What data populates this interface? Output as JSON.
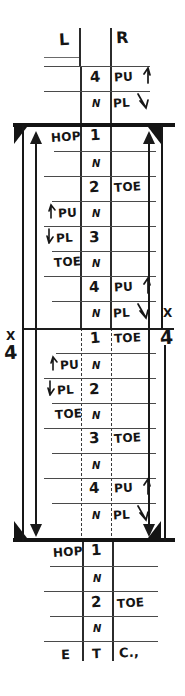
{
  "sheet": {
    "title_row": {
      "left": "L",
      "center": "",
      "right": "R"
    },
    "footer_row": {
      "left": "E",
      "center": "T",
      "right": "C.,"
    },
    "repeat_marks": {
      "left_x": "X",
      "left_count": "4",
      "right_x": "X",
      "right_count": "4"
    },
    "colors": {
      "ink": "#151515",
      "rule": "#4a4a4a",
      "beam": "#141414"
    }
  },
  "columns": {
    "left_header": "L",
    "center_header": "",
    "right_header": "R"
  },
  "rows": [
    {
      "id": "r01",
      "left": "",
      "center": "4",
      "right": "PU",
      "right_arrow": "up",
      "beat": "4"
    },
    {
      "id": "r02",
      "left": "",
      "center": "N",
      "right": "PL",
      "right_arrow": "down",
      "beat": "and"
    },
    {
      "id": "r03",
      "left": "HOP",
      "center": "1",
      "right": "",
      "right_arrow": "",
      "beat": "1"
    },
    {
      "id": "r04",
      "left": "",
      "center": "N",
      "right": "",
      "right_arrow": "",
      "beat": "and"
    },
    {
      "id": "r05",
      "left": "",
      "center": "2",
      "right": "TOE",
      "right_arrow": "",
      "beat": "2"
    },
    {
      "id": "r06",
      "left": "PU",
      "left_arrow": "up",
      "center": "N",
      "right": "",
      "right_arrow": "",
      "beat": "and"
    },
    {
      "id": "r07",
      "left": "PL",
      "left_arrow": "down",
      "center": "3",
      "right": "",
      "right_arrow": "",
      "beat": "3"
    },
    {
      "id": "r08",
      "left": "TOE",
      "center": "N",
      "right": "",
      "right_arrow": "",
      "beat": "and"
    },
    {
      "id": "r09",
      "left": "",
      "center": "4",
      "right": "PU",
      "right_arrow": "up",
      "beat": "4"
    },
    {
      "id": "r10",
      "left": "",
      "center": "N",
      "right": "PL",
      "right_arrow": "down",
      "beat": "and"
    },
    {
      "id": "r11",
      "left": "",
      "center": "1",
      "right": "TOE",
      "right_arrow": "",
      "beat": "1"
    },
    {
      "id": "r12",
      "left": "PU",
      "left_arrow": "up",
      "center": "N",
      "right": "",
      "right_arrow": "",
      "beat": "and"
    },
    {
      "id": "r13",
      "left": "PL",
      "left_arrow": "down",
      "center": "2",
      "right": "",
      "right_arrow": "",
      "beat": "2"
    },
    {
      "id": "r14",
      "left": "TOE",
      "center": "N",
      "right": "",
      "right_arrow": "",
      "beat": "and"
    },
    {
      "id": "r15",
      "left": "",
      "center": "3",
      "right": "TOE",
      "right_arrow": "",
      "beat": "3"
    },
    {
      "id": "r16",
      "left": "",
      "center": "N",
      "right": "",
      "right_arrow": "",
      "beat": "and"
    },
    {
      "id": "r17",
      "left": "",
      "center": "4",
      "right": "PU",
      "right_arrow": "up",
      "beat": "4"
    },
    {
      "id": "r18",
      "left": "",
      "center": "N",
      "right": "PL",
      "right_arrow": "down",
      "beat": "and"
    },
    {
      "id": "r19",
      "left": "HOP",
      "center": "1",
      "right": "",
      "right_arrow": "",
      "beat": "1"
    },
    {
      "id": "r20",
      "left": "",
      "center": "N",
      "right": "",
      "right_arrow": "",
      "beat": "and"
    },
    {
      "id": "r21",
      "left": "",
      "center": "2",
      "right": "TOE",
      "right_arrow": "",
      "beat": "2"
    },
    {
      "id": "r22",
      "left": "",
      "center": "N",
      "right": "",
      "right_arrow": "",
      "beat": "and"
    }
  ]
}
